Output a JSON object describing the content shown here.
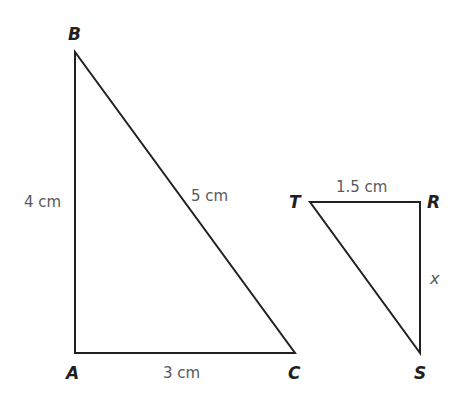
{
  "diagram": {
    "triangles": [
      {
        "name": "ABC",
        "vertices": {
          "A": {
            "label": "A",
            "x": 75,
            "y": 353
          },
          "B": {
            "label": "B",
            "x": 75,
            "y": 52
          },
          "C": {
            "label": "C",
            "x": 295,
            "y": 353
          }
        },
        "sides": {
          "AB": {
            "label": "4 cm"
          },
          "BC": {
            "label": "5 cm"
          },
          "AC": {
            "label": "3 cm"
          }
        }
      },
      {
        "name": "TRS",
        "vertices": {
          "T": {
            "label": "T",
            "x": 310,
            "y": 202
          },
          "R": {
            "label": "R",
            "x": 420,
            "y": 202
          },
          "S": {
            "label": "S",
            "x": 420,
            "y": 353
          }
        },
        "sides": {
          "TR": {
            "label": "1.5 cm"
          },
          "RS": {
            "label": "x"
          }
        }
      }
    ],
    "colors": {
      "stroke": "#231f20",
      "vertex_label": "#231f20",
      "measure_label": "#58595b"
    }
  }
}
